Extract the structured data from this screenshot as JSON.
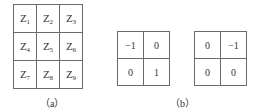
{
  "figure_a": {
    "caption": "（a）",
    "cells": [
      [
        {
          "base": "Z",
          "sub": "1"
        },
        {
          "base": "Z",
          "sub": "2"
        },
        {
          "base": "Z",
          "sub": "3"
        }
      ],
      [
        {
          "base": "Z",
          "sub": "4"
        },
        {
          "base": "Z",
          "sub": "5"
        },
        {
          "base": "Z",
          "sub": "6"
        }
      ],
      [
        {
          "base": "Z",
          "sub": "7"
        },
        {
          "base": "Z",
          "sub": "8"
        },
        {
          "base": "Z",
          "sub": "9"
        }
      ]
    ]
  },
  "figure_b": {
    "caption": "（b）",
    "kernel_1": [
      [
        "−1",
        "0"
      ],
      [
        "0",
        "1"
      ]
    ],
    "kernel_2": [
      [
        "0",
        "−1"
      ],
      [
        "0",
        "0"
      ]
    ]
  }
}
